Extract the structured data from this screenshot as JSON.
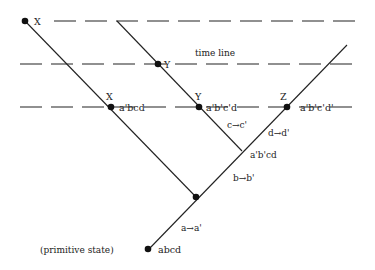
{
  "diagram": {
    "title_label": "time line",
    "time_lines": [
      {
        "name": "upper",
        "y": 21
      },
      {
        "name": "middle",
        "y": 64
      },
      {
        "name": "lower",
        "y": 107
      }
    ],
    "nodes": {
      "x_top": {
        "label": "X"
      },
      "y_mid": {
        "label": "Y"
      },
      "x_low": {
        "label": "X",
        "state": "a'bcd"
      },
      "y_low": {
        "label": "Y",
        "state": "a'b'c'd"
      },
      "z_low": {
        "label": "Z",
        "state": "a'b'c'd'"
      },
      "branch_bd": {
        "state": "a'b'cd"
      },
      "primitive": {
        "label": "(primitive state)",
        "state": "abcd"
      }
    },
    "transitions": {
      "a": "a→a'",
      "b": "b→b'",
      "c": "c→c'",
      "d": "d→d'"
    },
    "colors": {
      "ink": "#222222",
      "background": "#ffffff"
    }
  }
}
